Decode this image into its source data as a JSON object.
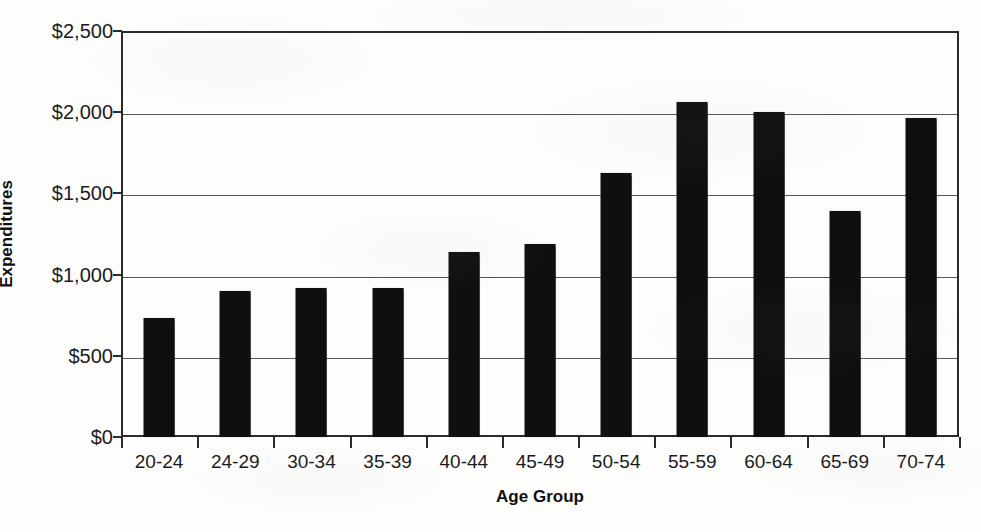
{
  "chart_data": {
    "type": "bar",
    "title": "",
    "subtitle": "",
    "xlabel": "Age Group",
    "ylabel": "Expenditures",
    "categories": [
      "20-24",
      "24-29",
      "30-34",
      "35-39",
      "40-44",
      "45-49",
      "50-54",
      "55-59",
      "60-64",
      "65-69",
      "70-74"
    ],
    "values": [
      735,
      900,
      920,
      920,
      1140,
      1190,
      1625,
      2060,
      2000,
      1390,
      1965
    ],
    "series": [
      {
        "name": "Expenditures",
        "values": [
          735,
          900,
          920,
          920,
          1140,
          1190,
          1625,
          2060,
          2000,
          1390,
          1965
        ]
      }
    ],
    "ylim": [
      0,
      2500
    ],
    "y_ticks": [
      0,
      500,
      1000,
      1500,
      2000,
      2500
    ],
    "y_tick_labels": [
      "$0",
      "$500",
      "$1,000",
      "$1,500",
      "$2,000",
      "$2,500"
    ],
    "grid": "horizontal",
    "legend": "none",
    "bar_color": "#100f0f",
    "axis_color": "#2b2b2b",
    "gridline_color": "#575757",
    "background_color": "#fdfdfc",
    "annotations": []
  }
}
